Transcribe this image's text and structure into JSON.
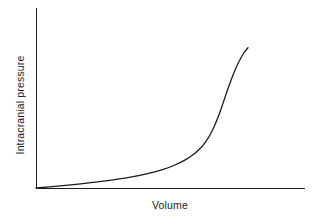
{
  "figure": {
    "background_color": "#ffffff",
    "line_color": "#1c1c1c",
    "width": 316,
    "height": 218
  },
  "axes": {
    "y_label": "Intracranial pressure",
    "x_label": "Volume",
    "origin": {
      "x": 36,
      "y": 188
    },
    "y_axis_top": {
      "x": 36,
      "y": 8
    },
    "x_axis_right": {
      "x": 305,
      "y": 188
    }
  },
  "chart_data": {
    "type": "line",
    "title": "",
    "xlabel": "Volume",
    "ylabel": "Intracranial pressure",
    "xlim": [
      0,
      1
    ],
    "ylim": [
      0,
      1
    ],
    "grid": false,
    "legend": false,
    "axis_ticks": false,
    "series": [
      {
        "name": "Pressure-volume curve",
        "color": "#1c1c1c",
        "x": [
          0.0,
          0.1,
          0.2,
          0.3,
          0.4,
          0.5,
          0.55,
          0.6,
          0.65,
          0.7,
          0.75,
          0.78,
          0.8,
          0.82,
          0.84,
          0.86,
          0.88,
          0.9,
          0.92,
          0.94,
          0.96,
          0.98,
          1.0
        ],
        "y": [
          0.0,
          0.012,
          0.026,
          0.042,
          0.062,
          0.088,
          0.104,
          0.124,
          0.15,
          0.184,
          0.232,
          0.272,
          0.308,
          0.352,
          0.408,
          0.476,
          0.556,
          0.64,
          0.718,
          0.79,
          0.85,
          0.9,
          0.935
        ]
      }
    ],
    "pixel_path": "M 36 188 C 90 185.5, 150 179, 186 170 C 206 164, 222 150, 234 122 C 242 102, 246 70, 248 39"
  }
}
